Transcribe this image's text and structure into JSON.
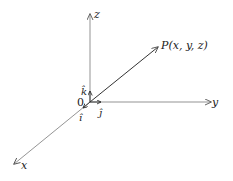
{
  "diagram": {
    "axes": {
      "x_label": "x",
      "y_label": "y",
      "z_label": "z"
    },
    "origin_label": "0",
    "unit_vectors": {
      "i_label": "î",
      "j_label": "ĵ",
      "k_label": "k̂"
    },
    "point_label": "P(x, y, z)",
    "colors": {
      "axis": "#666666",
      "vector": "#333333",
      "text": "#222222"
    }
  }
}
